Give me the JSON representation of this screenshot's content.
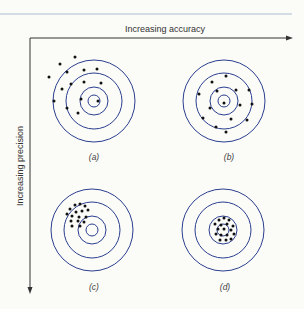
{
  "figure": {
    "x_axis_label": "Increasing accuracy",
    "y_axis_label": "Increasing precision",
    "ring_color": "#2b3f8f",
    "rule_color": "#a9bfd3",
    "dot_color": "#111111",
    "panels": [
      {
        "id": "a",
        "label": "(a)",
        "center": [
          94,
          101
        ],
        "description": "low accuracy, low precision",
        "dots": [
          [
            75,
            57
          ],
          [
            60,
            64
          ],
          [
            49,
            77
          ],
          [
            67,
            72
          ],
          [
            84,
            70
          ],
          [
            97,
            69
          ],
          [
            62,
            89
          ],
          [
            71,
            84
          ],
          [
            84,
            82
          ],
          [
            101,
            83
          ],
          [
            54,
            101
          ],
          [
            81,
            99
          ],
          [
            98,
            101
          ],
          [
            67,
            108
          ],
          [
            78,
            113
          ]
        ]
      },
      {
        "id": "b",
        "label": "(b)",
        "center": [
          224,
          101
        ],
        "description": "high accuracy, low precision",
        "dots": [
          [
            226,
            76
          ],
          [
            212,
            82
          ],
          [
            236,
            90
          ],
          [
            217,
            91
          ],
          [
            249,
            90
          ],
          [
            199,
            94
          ],
          [
            252,
            104
          ],
          [
            224,
            103
          ],
          [
            240,
            105
          ],
          [
            210,
            108
          ],
          [
            203,
            118
          ],
          [
            231,
            119
          ],
          [
            247,
            120
          ],
          [
            216,
            127
          ],
          [
            226,
            132
          ]
        ]
      },
      {
        "id": "c",
        "label": "(c)",
        "center": [
          92,
          230
        ],
        "description": "low accuracy, high precision",
        "dots": [
          [
            75,
            205
          ],
          [
            80,
            204
          ],
          [
            85,
            206
          ],
          [
            70,
            209
          ],
          [
            76,
            212
          ],
          [
            82,
            211
          ],
          [
            88,
            210
          ],
          [
            67,
            214
          ],
          [
            72,
            216
          ],
          [
            79,
            217
          ],
          [
            86,
            217
          ],
          [
            71,
            221
          ],
          [
            78,
            221
          ],
          [
            84,
            222
          ],
          [
            72,
            226
          ],
          [
            80,
            226
          ]
        ]
      },
      {
        "id": "d",
        "label": "(d)",
        "center": [
          223,
          230
        ],
        "description": "high accuracy, high precision",
        "dots": [
          [
            219,
            220
          ],
          [
            224,
            218
          ],
          [
            229,
            220
          ],
          [
            215,
            224
          ],
          [
            221,
            225
          ],
          [
            227,
            224
          ],
          [
            233,
            226
          ],
          [
            218,
            229
          ],
          [
            224,
            229
          ],
          [
            231,
            230
          ],
          [
            216,
            234
          ],
          [
            221,
            235
          ],
          [
            227,
            235
          ],
          [
            234,
            234
          ],
          [
            220,
            240
          ],
          [
            226,
            240
          ],
          [
            231,
            239
          ]
        ]
      }
    ],
    "ring_radii": [
      6,
      14,
      28,
      41
    ]
  }
}
